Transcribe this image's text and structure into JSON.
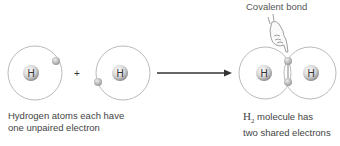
{
  "diagram": {
    "title_label": "Covalent bond",
    "atom_symbol": "H",
    "plus_sign": "+",
    "left_caption": {
      "line1": "Hydrogen atoms each have",
      "line2": "one unpaired electron"
    },
    "right_caption": {
      "formula_base": "H",
      "formula_sub": "2",
      "line1_rest": " molecule has",
      "line2": "two shared electrons"
    },
    "colors": {
      "orbit": "#9a9a9a",
      "electron": "#b8b8b8",
      "nucleus_light": "#ffffff",
      "nucleus_dark": "#9c9c9c",
      "arrow": "#333333",
      "text": "#444444"
    }
  }
}
